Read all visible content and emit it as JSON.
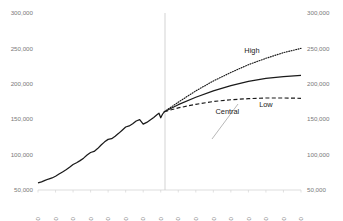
{
  "chart_data": {
    "type": "line",
    "title": "",
    "subtitle": "",
    "xlabel": "",
    "ylabel": "",
    "xlim": [
      1950,
      2100
    ],
    "ylim": [
      50000,
      300000
    ],
    "grid": false,
    "legend_position": "inline-annotations",
    "y_ticks": [
      50000,
      100000,
      150000,
      200000,
      250000,
      300000
    ],
    "y_tick_labels": [
      "50,000",
      "100,000",
      "150,000",
      "200,000",
      "250,000",
      "300,000"
    ],
    "y_axis_right_labels": [
      "50,000",
      "100,000",
      "150,000",
      "200,000",
      "250,000",
      "300,000"
    ],
    "x_ticks": [
      1950,
      1960,
      1970,
      1980,
      1990,
      2000,
      2010,
      2020,
      2030,
      2040,
      2050,
      2060,
      2070,
      2080,
      2090,
      2100
    ],
    "x_tick_labels": [
      "1950",
      "1960",
      "1970",
      "1980",
      "1990",
      "2000",
      "2010",
      "2020",
      "2030",
      "2040",
      "2050",
      "2060",
      "2070",
      "2080",
      "2090",
      "2100"
    ],
    "divider_x": 2020,
    "annotations": [
      {
        "text": "High",
        "x": 2072,
        "y": 243000
      },
      {
        "text": "Central",
        "x": 2058,
        "y": 157000
      },
      {
        "text": "Low",
        "x": 2080,
        "y": 167000
      }
    ],
    "series": [
      {
        "name": "Historical",
        "style": "solid",
        "x": [
          1950,
          1952,
          1954,
          1956,
          1958,
          1960,
          1962,
          1964,
          1966,
          1968,
          1970,
          1972,
          1974,
          1976,
          1978,
          1980,
          1982,
          1984,
          1986,
          1988,
          1990,
          1992,
          1994,
          1996,
          1998,
          2000,
          2002,
          2004,
          2006,
          2008,
          2010,
          2012,
          2014,
          2016,
          2018,
          2019,
          2020,
          2021,
          2022
        ],
        "values": [
          60000,
          61500,
          63500,
          65500,
          67000,
          69500,
          72500,
          75500,
          78500,
          82000,
          86000,
          88500,
          91500,
          95000,
          99500,
          103000,
          104500,
          108500,
          113500,
          118000,
          121500,
          122500,
          126000,
          130000,
          134500,
          139000,
          140500,
          143500,
          147500,
          149500,
          143000,
          145500,
          149000,
          152500,
          156500,
          158500,
          152000,
          157000,
          160500
        ]
      },
      {
        "name": "High",
        "style": "dotted",
        "x": [
          2022,
          2030,
          2040,
          2050,
          2060,
          2070,
          2080,
          2090,
          2100
        ],
        "values": [
          160500,
          174000,
          190000,
          204000,
          216000,
          227000,
          236000,
          244000,
          250000
        ]
      },
      {
        "name": "Central",
        "style": "solid",
        "x": [
          2022,
          2030,
          2040,
          2050,
          2060,
          2070,
          2080,
          2090,
          2100
        ],
        "values": [
          160500,
          170500,
          181000,
          190000,
          197500,
          203500,
          207500,
          210000,
          212000
        ]
      },
      {
        "name": "Low",
        "style": "dashed",
        "x": [
          2022,
          2030,
          2040,
          2050,
          2060,
          2070,
          2080,
          2090,
          2100
        ],
        "values": [
          160500,
          166000,
          171000,
          175000,
          177500,
          179000,
          180000,
          180000,
          179500
        ]
      }
    ]
  }
}
